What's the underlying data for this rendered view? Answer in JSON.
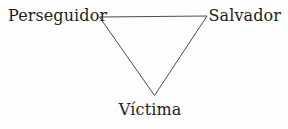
{
  "diagram": {
    "type": "drama-triangle",
    "labels": {
      "top_left": "Perseguidor",
      "top_right": "Salvador",
      "bottom": "Víctima"
    },
    "colors": {
      "background": "#fdfdfd",
      "line": "#4c4c4c",
      "text": "#1e1e1e"
    }
  }
}
